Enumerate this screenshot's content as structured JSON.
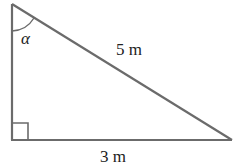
{
  "diagram": {
    "type": "right-triangle",
    "angle_label": "α",
    "hypotenuse_label": "5 m",
    "base_label": "3 m",
    "right_angle_marker": true,
    "stroke_color": "#666666"
  }
}
